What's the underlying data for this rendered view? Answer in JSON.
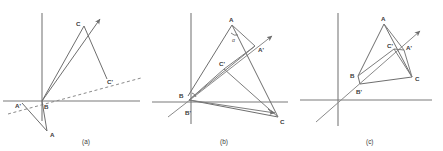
{
  "figure": {
    "width": 443,
    "height": 151,
    "background": "#ffffff",
    "line_color": "#6e6e6e",
    "axis_color": "#7a7a7a",
    "label_color": "#3a3a3a"
  },
  "panels": [
    {
      "id": "a",
      "caption": "(a)",
      "caption_pos": [
        86,
        142
      ],
      "origin": [
        42,
        101
      ],
      "description": "Reflection of triangle ABC across a dashed mirror line through B",
      "axes": {
        "x_axis": [
          3,
          101,
          140,
          101
        ],
        "y_axis": [
          42,
          13,
          42,
          121
        ]
      },
      "mirror_line": {
        "style": "dashed",
        "from": [
          8,
          114
        ],
        "to": [
          141,
          78
        ]
      },
      "ray": {
        "from": [
          42,
          101
        ],
        "to": [
          104,
          14
        ],
        "arrow": true
      },
      "points": {
        "A": {
          "label": "A",
          "x": 47,
          "y": 131,
          "lx": 50,
          "ly": 136
        },
        "Ap": {
          "label": "A'",
          "x": 22,
          "y": 103,
          "lx": 16,
          "ly": 108
        },
        "B": {
          "label": "B",
          "x": 42,
          "y": 101,
          "lx": 44,
          "ly": 108
        },
        "C": {
          "label": "C",
          "x": 84,
          "y": 26,
          "lx": 78,
          "ly": 25
        },
        "Cp": {
          "label": "C'",
          "x": 107,
          "y": 79,
          "lx": 108,
          "ly": 83
        }
      },
      "segments": [
        [
          "B",
          "C"
        ],
        [
          "C",
          "Cp"
        ],
        [
          "B",
          "A"
        ],
        [
          "A",
          "Ap"
        ]
      ]
    },
    {
      "id": "b",
      "caption": "(b)",
      "caption_pos": [
        224,
        142
      ],
      "origin": [
        191,
        102
      ],
      "description": "Triangle ABC and its reflected image A'B'C' about a line through origin",
      "axes": {
        "x_axis": [
          152,
          102,
          288,
          102
        ],
        "y_axis": [
          191,
          13,
          191,
          124
        ]
      },
      "mirror_line": {
        "style": "solid",
        "from": [
          168,
          117
        ],
        "to": [
          275,
          33
        ],
        "arrow": true
      },
      "angle_label": {
        "text": "α",
        "x": 234,
        "y": 40
      },
      "points": {
        "A": {
          "label": "A",
          "x": 232,
          "y": 25,
          "lx": 230,
          "ly": 22
        },
        "Ap": {
          "label": "A'",
          "x": 255,
          "y": 46,
          "lx": 258,
          "ly": 51
        },
        "B": {
          "label": "B",
          "x": 188,
          "y": 96,
          "lx": 181,
          "ly": 96
        },
        "Bp": {
          "label": "B'",
          "x": 190,
          "y": 104,
          "lx": 186,
          "ly": 114
        },
        "C": {
          "label": "C",
          "x": 278,
          "y": 117,
          "lx": 280,
          "ly": 123
        },
        "Cp": {
          "label": "C'",
          "x": 224,
          "y": 69,
          "lx": 221,
          "ly": 66
        }
      },
      "segments": [
        [
          "B",
          "A"
        ],
        [
          "A",
          "C"
        ],
        [
          "C",
          "B"
        ],
        [
          "B",
          "Ap"
        ],
        [
          "Ap",
          "A"
        ],
        [
          "B",
          "Cp"
        ],
        [
          "Cp",
          "C"
        ],
        [
          "Cp",
          "Ap"
        ]
      ]
    },
    {
      "id": "c",
      "caption": "(c)",
      "caption_pos": [
        370,
        142
      ],
      "origin": [
        338,
        100
      ],
      "description": "Triangle ABC with reflected triangle A'B'C' sharing vertex region near B",
      "axes": {
        "x_axis": [
          300,
          100,
          432,
          100
        ],
        "y_axis": [
          338,
          13,
          338,
          126
        ]
      },
      "mirror_line": {
        "style": "solid",
        "from": [
          316,
          122
        ],
        "to": [
          423,
          28
        ],
        "arrow": true
      },
      "points": {
        "A": {
          "label": "A",
          "x": 384,
          "y": 24,
          "lx": 382,
          "ly": 21
        },
        "Ap": {
          "label": "A'",
          "x": 404,
          "y": 50,
          "lx": 407,
          "ly": 49
        },
        "B": {
          "label": "B",
          "x": 358,
          "y": 76,
          "lx": 351,
          "ly": 76
        },
        "Bp": {
          "label": "B'",
          "x": 360,
          "y": 84,
          "lx": 357,
          "ly": 92
        },
        "C": {
          "label": "C",
          "x": 412,
          "y": 77,
          "lx": 415,
          "ly": 80
        },
        "Cp": {
          "label": "C'",
          "x": 394,
          "y": 49,
          "lx": 389,
          "ly": 47
        }
      },
      "segments": [
        [
          "B",
          "A"
        ],
        [
          "A",
          "C"
        ],
        [
          "C",
          "Bp"
        ],
        [
          "Bp",
          "B"
        ],
        [
          "A",
          "Ap"
        ],
        [
          "Ap",
          "C"
        ],
        [
          "B",
          "Cp"
        ],
        [
          "Cp",
          "C"
        ],
        [
          "Cp",
          "Ap"
        ]
      ]
    }
  ]
}
